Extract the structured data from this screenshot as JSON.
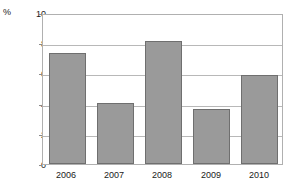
{
  "chart_data": {
    "type": "bar",
    "title": "",
    "subtitle": "",
    "xlabel": "",
    "ylabel": "%",
    "unit_label": "%",
    "categories": [
      "2006",
      "2007",
      "2008",
      "2009",
      "2010"
    ],
    "values": [
      7.35,
      4.05,
      8.15,
      3.65,
      5.9
    ],
    "series": [
      {
        "name": "",
        "values": [
          7.35,
          4.05,
          8.15,
          3.65,
          5.9
        ]
      }
    ],
    "ylim": [
      0,
      10
    ],
    "yticks": [
      0,
      2,
      4,
      6,
      8,
      10
    ],
    "ytick_labels": [
      "0",
      "2",
      "4",
      "6",
      "8",
      "10"
    ],
    "gridlines": [
      2,
      4,
      6,
      8
    ],
    "grid": true,
    "legend": false,
    "legend_position": "none",
    "bar_color": "#9a9a9a",
    "bar_border_color": "#6f6f6f",
    "grid_color": "#b8b8b8",
    "axis_color": "#b0b0b0",
    "background_color": "#ffffff",
    "text_color": "#1a1a1a"
  }
}
